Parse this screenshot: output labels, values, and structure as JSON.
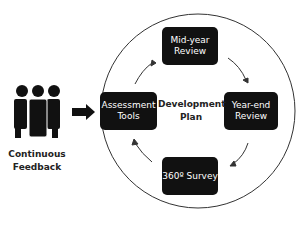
{
  "diagram": {
    "center_label": [
      "Development",
      "Plan"
    ],
    "people_label": [
      "Continuous",
      "Feedback"
    ],
    "nodes": [
      {
        "id": "mid",
        "lines": [
          "Mid-year",
          "Review"
        ]
      },
      {
        "id": "end",
        "lines": [
          "Year-end",
          "Review"
        ]
      },
      {
        "id": "survey",
        "lines": [
          "360º Survey"
        ]
      },
      {
        "id": "assess",
        "lines": [
          "Assessment",
          "Tools"
        ]
      }
    ],
    "icons": [
      "people-group-icon",
      "arrow-right-icon"
    ],
    "colors": {
      "box": "#111111",
      "text": "#ffffff",
      "circle": "#333333"
    }
  }
}
